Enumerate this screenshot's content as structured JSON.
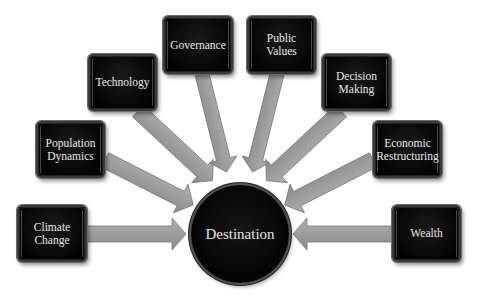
{
  "diagram": {
    "center": {
      "label": "Destination"
    },
    "factors": [
      {
        "id": "climate-change",
        "label": "Climate\nChange"
      },
      {
        "id": "population-dynamics",
        "label": "Population\nDynamics"
      },
      {
        "id": "technology",
        "label": "Technology"
      },
      {
        "id": "governance",
        "label": "Governance"
      },
      {
        "id": "public-values",
        "label": "Public\nValues"
      },
      {
        "id": "decision-making",
        "label": "Decision\nMaking"
      },
      {
        "id": "economic-restructuring",
        "label": "Economic\nRestructuring"
      },
      {
        "id": "wealth",
        "label": "Wealth"
      }
    ],
    "colors": {
      "box_fill": "#000000",
      "arrow_fill": "#9a9a9a",
      "text": "#e8e8e8",
      "background": "#ffffff"
    }
  }
}
